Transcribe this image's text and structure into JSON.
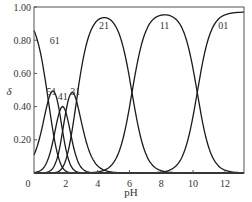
{
  "chart_data": {
    "type": "line",
    "title": "",
    "xlabel": "pH",
    "ylabel": "δ",
    "xlim": [
      0,
      13.2
    ],
    "ylim": [
      0,
      1.0
    ],
    "x_ticks": [
      0,
      2,
      4,
      6,
      8,
      10,
      12
    ],
    "x_tick_labels": [
      "0",
      "2",
      "4",
      "6",
      "8",
      "10",
      "12"
    ],
    "y_ticks": [
      0.2,
      0.4,
      0.6,
      0.8,
      1.0
    ],
    "y_tick_labels": [
      "0.20",
      "0.40",
      "0.60",
      "0.80",
      "1.00"
    ],
    "grid": false,
    "legend": "none (curves labeled inline)",
    "pKa": [
      0.9,
      1.6,
      2.0,
      2.67,
      6.16,
      10.26
    ],
    "series": [
      {
        "name": "61",
        "label_pos": [
          1.3,
          0.78
        ],
        "description": "starts ~0.85 at pH 0, falls to 0 by ~pH 3"
      },
      {
        "name": "51",
        "label_pos": [
          1.1,
          0.47
        ],
        "peak": {
          "x": 1.3,
          "y": 0.48
        }
      },
      {
        "name": "41",
        "label_pos": [
          1.8,
          0.44
        ],
        "peak": {
          "x": 1.8,
          "y": 0.4
        }
      },
      {
        "name": "31",
        "label_pos": [
          2.6,
          0.47
        ],
        "peak": {
          "x": 2.6,
          "y": 0.48
        }
      },
      {
        "name": "21",
        "label_pos": [
          4.4,
          0.87
        ],
        "peak": {
          "x": 4.4,
          "y": 0.97
        }
      },
      {
        "name": "11",
        "label_pos": [
          8.2,
          0.87
        ],
        "peak": {
          "x": 8.2,
          "y": 0.98
        }
      },
      {
        "name": "01",
        "label_pos": [
          11.9,
          0.87
        ],
        "description": "rises after pH 9, reaches ~1.0 at pH 13"
      }
    ]
  }
}
